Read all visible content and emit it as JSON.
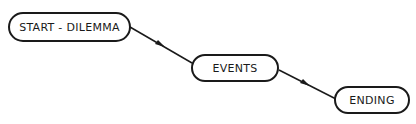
{
  "diagram": {
    "type": "flow",
    "nodes": [
      {
        "id": "start",
        "label": "START - DILEMMA"
      },
      {
        "id": "events",
        "label": "EVENTS"
      },
      {
        "id": "ending",
        "label": "ENDING"
      }
    ],
    "edges": [
      {
        "from": "start",
        "to": "events"
      },
      {
        "from": "events",
        "to": "ending"
      }
    ],
    "colors": {
      "stroke": "#1a1a1a",
      "background": "#ffffff"
    }
  }
}
